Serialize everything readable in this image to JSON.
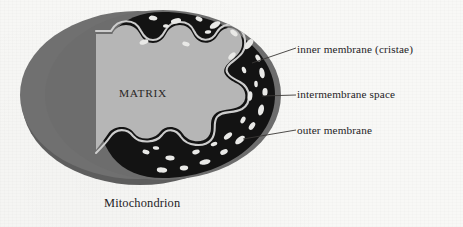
{
  "figure": {
    "caption": "Mitochondrion",
    "interior_label": "MATRIX",
    "callouts": [
      {
        "id": "inner-membrane",
        "text": "inner membrane (cristae)"
      },
      {
        "id": "intermembrane",
        "text": "intermembrane space"
      },
      {
        "id": "outer-membrane",
        "text": "outer membrane"
      }
    ],
    "colors": {
      "background": "#f8f8f6",
      "outer_body_gray": "#6e6e6e",
      "outer_body_shadow": "#5e5e5e",
      "matrix_light_gray": "#b5b5b5",
      "intermembrane_black": "#131313",
      "inner_membrane_line": "#c9c9c9",
      "speckle_white": "#e8e8e6",
      "text": "#24221f",
      "leader_line": "#3a3836"
    }
  }
}
